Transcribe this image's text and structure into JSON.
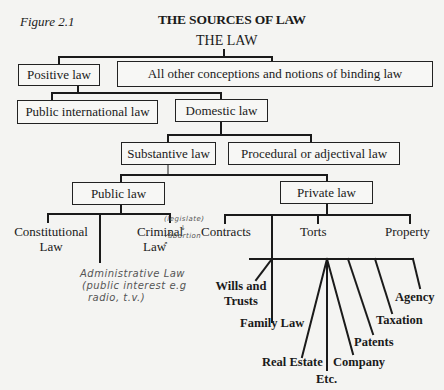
{
  "figure": {
    "label": "Figure 2.1",
    "title": "THE SOURCES OF LAW",
    "root": "THE LAW"
  },
  "nodes": {
    "positive_law": "Positive law",
    "other_conceptions": "All other conceptions and notions of binding law",
    "public_international_law": "Public international  law",
    "domestic_law": "Domestic law",
    "substantive_law": "Substantive law",
    "procedural_law": "Procedural or adjectival law",
    "public_law": "Public law",
    "private_law": "Private law"
  },
  "public_law_branches": {
    "constitutional_line1": "Constitutional",
    "constitutional_line2": "Law",
    "criminal_line1": "Criminal",
    "criminal_line2": "Law"
  },
  "private_law_branches": {
    "contracts": "Contracts",
    "torts": "Torts",
    "property": "Property"
  },
  "tort_subbranches": {
    "wills_line1": "Wills and",
    "wills_line2": "Trusts",
    "family_law": "Family Law",
    "real_estate": "Real Estate",
    "etc": "Etc.",
    "company": "Company",
    "patents": "Patents",
    "taxation": "Taxation",
    "agency": "Agency"
  },
  "handwritten_notes": {
    "legislate": "(legislate)",
    "arrow_down": "↓",
    "abortion": "abortion",
    "arrow": "↗",
    "admin_line1": "Administrative Law",
    "admin_line2": "(public interest e.g",
    "admin_line3": "radio, t.v.)"
  }
}
